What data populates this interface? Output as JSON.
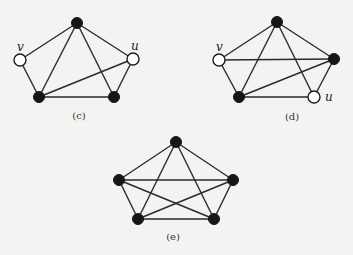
{
  "figure": {
    "graphs": [
      {
        "id": "c",
        "caption": "(c)",
        "caption_pos": [
          79,
          119
        ],
        "nodes": [
          {
            "id": "top",
            "x": 77,
            "y": 23,
            "filled": true,
            "label": ""
          },
          {
            "id": "v",
            "x": 20,
            "y": 60,
            "filled": false,
            "label": "v",
            "label_pos": [
              17,
              51
            ]
          },
          {
            "id": "u",
            "x": 133,
            "y": 59,
            "filled": false,
            "label": "u",
            "label_pos": [
              131,
              50
            ]
          },
          {
            "id": "bl",
            "x": 39,
            "y": 97,
            "filled": true,
            "label": ""
          },
          {
            "id": "br",
            "x": 114,
            "y": 97,
            "filled": true,
            "label": ""
          }
        ],
        "edges": [
          [
            "top",
            "v"
          ],
          [
            "top",
            "bl"
          ],
          [
            "top",
            "br"
          ],
          [
            "top",
            "u"
          ],
          [
            "v",
            "bl"
          ],
          [
            "bl",
            "br"
          ],
          [
            "bl",
            "u"
          ],
          [
            "br",
            "u"
          ]
        ]
      },
      {
        "id": "d",
        "caption": "(d)",
        "caption_pos": [
          292,
          120
        ],
        "nodes": [
          {
            "id": "top",
            "x": 277,
            "y": 22,
            "filled": true,
            "label": ""
          },
          {
            "id": "v",
            "x": 219,
            "y": 60,
            "filled": false,
            "label": "v",
            "label_pos": [
              216,
              51
            ]
          },
          {
            "id": "right",
            "x": 334,
            "y": 59,
            "filled": true,
            "label": ""
          },
          {
            "id": "bl",
            "x": 239,
            "y": 97,
            "filled": true,
            "label": ""
          },
          {
            "id": "u",
            "x": 314,
            "y": 97,
            "filled": false,
            "label": "u",
            "label_pos": [
              325,
              101
            ]
          }
        ],
        "edges": [
          [
            "top",
            "v"
          ],
          [
            "top",
            "right"
          ],
          [
            "top",
            "bl"
          ],
          [
            "top",
            "u"
          ],
          [
            "v",
            "right"
          ],
          [
            "v",
            "bl"
          ],
          [
            "bl",
            "right"
          ],
          [
            "bl",
            "u"
          ],
          [
            "right",
            "u"
          ]
        ]
      },
      {
        "id": "e",
        "caption": "(e)",
        "caption_pos": [
          173,
          240
        ],
        "nodes": [
          {
            "id": "top",
            "x": 176,
            "y": 142,
            "filled": true,
            "label": ""
          },
          {
            "id": "left",
            "x": 119,
            "y": 180,
            "filled": true,
            "label": ""
          },
          {
            "id": "right",
            "x": 233,
            "y": 180,
            "filled": true,
            "label": ""
          },
          {
            "id": "bl",
            "x": 138,
            "y": 219,
            "filled": true,
            "label": ""
          },
          {
            "id": "br",
            "x": 214,
            "y": 219,
            "filled": true,
            "label": ""
          }
        ],
        "edges": [
          [
            "top",
            "left"
          ],
          [
            "top",
            "right"
          ],
          [
            "top",
            "bl"
          ],
          [
            "top",
            "br"
          ],
          [
            "left",
            "right"
          ],
          [
            "left",
            "bl"
          ],
          [
            "left",
            "br"
          ],
          [
            "right",
            "bl"
          ],
          [
            "right",
            "br"
          ],
          [
            "bl",
            "br"
          ]
        ]
      }
    ],
    "node_radius": 6
  }
}
